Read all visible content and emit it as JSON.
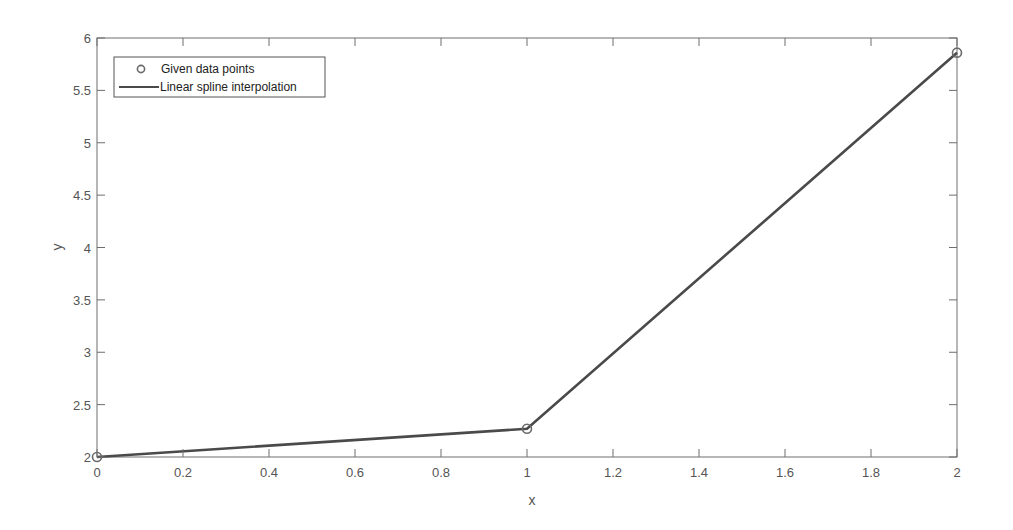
{
  "chart_data": {
    "type": "line",
    "title": "",
    "xlabel": "x",
    "ylabel": "y",
    "xlim": [
      0,
      2
    ],
    "ylim": [
      2,
      6
    ],
    "grid": false,
    "legend_position": "upper-left",
    "xticks": [
      "0",
      "0.2",
      "0.4",
      "0.6",
      "0.8",
      "1",
      "1.2",
      "1.4",
      "1.6",
      "1.8",
      "2"
    ],
    "yticks": [
      "2",
      "2.5",
      "3",
      "3.5",
      "4",
      "4.5",
      "5",
      "5.5",
      "6"
    ],
    "series": [
      {
        "name": "Given data points",
        "style": "markers",
        "marker": "circle",
        "x": [
          0,
          1,
          2
        ],
        "y": [
          2.0,
          2.27,
          5.86
        ]
      },
      {
        "name": "Linear spline interpolation",
        "style": "line",
        "x": [
          0,
          1,
          2
        ],
        "y": [
          2.0,
          2.27,
          5.86
        ]
      }
    ]
  },
  "legend": {
    "items": [
      "Given data points",
      "Linear spline interpolation"
    ]
  },
  "colors": {
    "line": "#4a4a4a",
    "marker": "#6a6a6a",
    "axis": "#6e6e6e",
    "text": "#555555"
  }
}
